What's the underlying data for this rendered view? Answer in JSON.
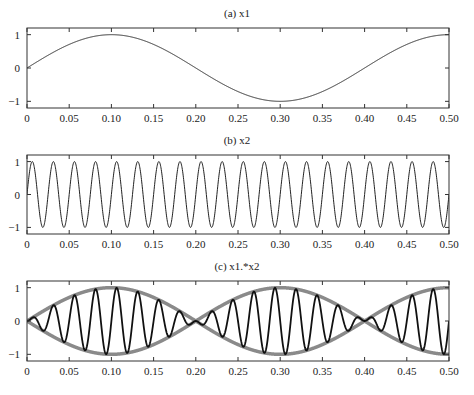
{
  "chart_data": [
    {
      "type": "line",
      "title": "(a) x1",
      "xlabel": "",
      "ylabel": "",
      "xlim": [
        0,
        0.5
      ],
      "ylim": [
        -1.2,
        1.2
      ],
      "grid": false,
      "x_ticks": [
        "0",
        "0.05",
        "0.10",
        "0.15",
        "0.20",
        "0.25",
        "0.30",
        "0.35",
        "0.40",
        "0.45",
        "0.50"
      ],
      "y_ticks": [
        "1",
        "0",
        "-1"
      ],
      "series": [
        {
          "name": "x1",
          "function": "sin(2*pi*2.5*t)",
          "frequency_hz": 2.5,
          "amplitude": 1,
          "color": "#222222",
          "x": [
            0,
            0.05,
            0.1,
            0.15,
            0.2,
            0.25,
            0.3,
            0.35,
            0.4,
            0.45,
            0.5
          ],
          "values": [
            0,
            1,
            0,
            -1,
            0,
            1,
            0,
            -1,
            0,
            1,
            0
          ]
        }
      ]
    },
    {
      "type": "line",
      "title": "(b) x2",
      "xlabel": "",
      "ylabel": "",
      "xlim": [
        0,
        0.5
      ],
      "ylim": [
        -1.2,
        1.2
      ],
      "grid": false,
      "x_ticks": [
        "0",
        "0.05",
        "0.10",
        "0.15",
        "0.20",
        "0.25",
        "0.30",
        "0.35",
        "0.40",
        "0.45",
        "0.50"
      ],
      "y_ticks": [
        "1",
        "0",
        "-1"
      ],
      "series": [
        {
          "name": "x2",
          "function": "sin(2*pi*40*t)",
          "frequency_hz": 40,
          "amplitude": 1,
          "cycles": 20,
          "color": "#222222"
        }
      ]
    },
    {
      "type": "line",
      "title": "(c) x1.*x2",
      "xlabel": "",
      "ylabel": "",
      "xlim": [
        0,
        0.5
      ],
      "ylim": [
        -1.2,
        1.2
      ],
      "grid": false,
      "x_ticks": [
        "0",
        "0.05",
        "0.10",
        "0.15",
        "0.20",
        "0.25",
        "0.30",
        "0.35",
        "0.40",
        "0.45",
        "0.50"
      ],
      "y_ticks": [
        "1",
        "0",
        "-1"
      ],
      "series": [
        {
          "name": "envelope +x1",
          "function": "sin(2*pi*2.5*t)",
          "color": "#8a8a8a",
          "width": 3.5
        },
        {
          "name": "envelope -x1",
          "function": "-sin(2*pi*2.5*t)",
          "color": "#8a8a8a",
          "width": 3.5
        },
        {
          "name": "x1.*x2",
          "function": "sin(2*pi*2.5*t)*sin(2*pi*40*t)",
          "color": "#111111",
          "width": 1.8
        }
      ]
    }
  ],
  "panels": [
    {
      "title": "(a) x1",
      "top": 28,
      "bottom": 108,
      "title_y": 7
    },
    {
      "title": "(b) x2",
      "top": 155,
      "bottom": 234,
      "title_y": 134
    },
    {
      "title": "(c) x1.*x2",
      "top": 281,
      "bottom": 361,
      "title_y": 260
    }
  ],
  "axes": {
    "left": 27,
    "right": 449
  },
  "colors": {
    "axis": "#333333",
    "line": "#222222",
    "envelope": "#8a8a8a"
  }
}
